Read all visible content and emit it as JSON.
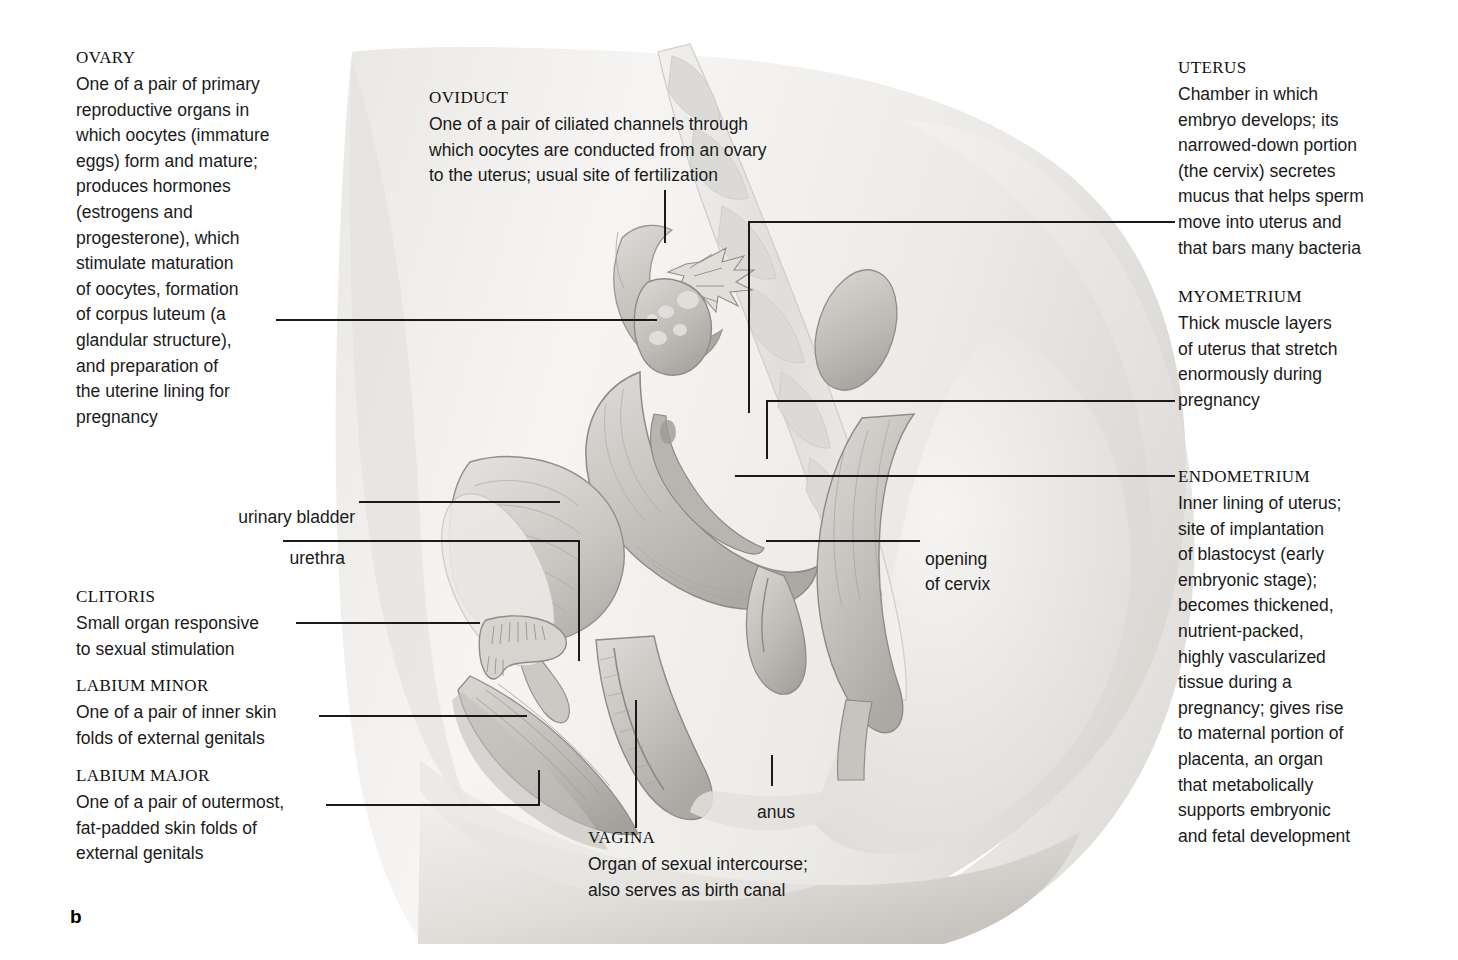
{
  "figure": {
    "panel_label": "b"
  },
  "labels": {
    "ovary": {
      "heading": "OVARY",
      "body": "One of a pair of primary\nreproductive organs in\nwhich oocytes (immature\neggs) form and mature;\nproduces hormones\n(estrogens and\nprogesterone), which\nstimulate maturation\nof oocytes, formation\nof corpus luteum (a\nglandular structure),\nand preparation of\nthe uterine lining for\npregnancy"
    },
    "oviduct": {
      "heading": "OVIDUCT",
      "body": "One of a pair of ciliated channels through\nwhich oocytes are conducted from an ovary\nto the uterus; usual site of fertilization"
    },
    "uterus": {
      "heading": "UTERUS",
      "body": "Chamber in which\nembryo develops; its\nnarrowed-down portion\n(the cervix) secretes\nmucus that helps sperm\nmove into uterus and\nthat bars many bacteria"
    },
    "myometrium": {
      "heading": "MYOMETRIUM",
      "body": "Thick muscle layers\nof uterus that stretch\nenormously during\npregnancy"
    },
    "endometrium": {
      "heading": "ENDOMETRIUM",
      "body": "Inner lining of uterus;\nsite of implantation\nof blastocyst (early\nembryonic stage);\nbecomes thickened,\nnutrient-packed,\nhighly vascularized\ntissue during a\npregnancy; gives rise\nto maternal portion of\nplacenta, an organ\nthat metabolically\nsupports embryonic\nand fetal development"
    },
    "clitoris": {
      "heading": "CLITORIS",
      "body": "Small organ responsive\nto sexual stimulation"
    },
    "labium_minor": {
      "heading": "LABIUM MINOR",
      "body": "One of a pair of inner skin\nfolds of external genitals"
    },
    "labium_major": {
      "heading": "LABIUM MAJOR",
      "body": "One of a pair of outermost,\nfat-padded skin folds of\nexternal genitals"
    },
    "vagina": {
      "heading": "VAGINA",
      "body": "Organ of sexual intercourse;\nalso serves as birth canal"
    },
    "urinary_bladder": {
      "text": "urinary bladder"
    },
    "urethra": {
      "text": "urethra"
    },
    "opening_of_cervix": {
      "text": "opening\nof cervix"
    },
    "anus": {
      "text": "anus"
    }
  },
  "colors": {
    "background": "#ffffff",
    "text": "#1a1a1a",
    "leader_line": "#1a1a1a",
    "illustration_light": "#f2f2f0",
    "illustration_mid": "#d8d7d4",
    "illustration_dark": "#a7a6a3"
  }
}
